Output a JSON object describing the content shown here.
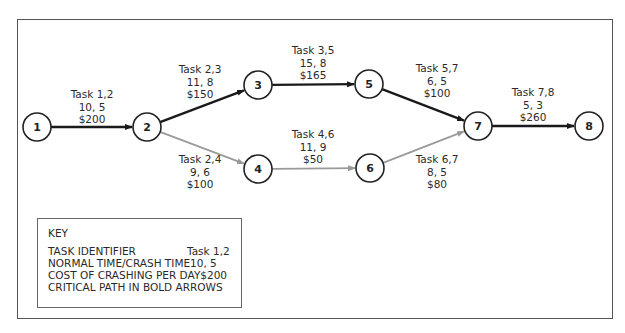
{
  "diagram": {
    "nodes": [
      {
        "id": "1",
        "x": 37,
        "y": 127
      },
      {
        "id": "2",
        "x": 147,
        "y": 127
      },
      {
        "id": "3",
        "x": 258,
        "y": 85
      },
      {
        "id": "4",
        "x": 258,
        "y": 169
      },
      {
        "id": "5",
        "x": 369,
        "y": 84
      },
      {
        "id": "6",
        "x": 370,
        "y": 168
      },
      {
        "id": "7",
        "x": 478,
        "y": 126
      },
      {
        "id": "8",
        "x": 589,
        "y": 126
      }
    ],
    "tasks": [
      {
        "from": "1",
        "to": "2",
        "label": "Task 1,2",
        "times": "10, 5",
        "cost": "$200",
        "critical": true
      },
      {
        "from": "2",
        "to": "3",
        "label": "Task 2,3",
        "times": "11, 8",
        "cost": "$150",
        "critical": true
      },
      {
        "from": "2",
        "to": "4",
        "label": "Task 2,4",
        "times": "9, 6",
        "cost": "$100",
        "critical": false
      },
      {
        "from": "3",
        "to": "5",
        "label": "Task 3,5",
        "times": "15, 8",
        "cost": "$165",
        "critical": true
      },
      {
        "from": "4",
        "to": "6",
        "label": "Task 4,6",
        "times": "11, 9",
        "cost": "$50",
        "critical": false
      },
      {
        "from": "5",
        "to": "7",
        "label": "Task 5,7",
        "times": "6, 5",
        "cost": "$100",
        "critical": true
      },
      {
        "from": "6",
        "to": "7",
        "label": "Task 6,7",
        "times": "8, 5",
        "cost": "$80",
        "critical": false
      },
      {
        "from": "7",
        "to": "8",
        "label": "Task 7,8",
        "times": "5, 3",
        "cost": "$260",
        "critical": true
      }
    ],
    "colors": {
      "critical": "#1a1a1a",
      "noncritical": "#9a9a9a",
      "node_stroke": "#222222"
    }
  },
  "key": {
    "title": "KEY",
    "rows": [
      {
        "label": "TASK IDENTIFIER",
        "value": "Task 1,2"
      },
      {
        "label": "NORMAL TIME/CRASH TIME",
        "value": "10, 5"
      },
      {
        "label": "COST OF CRASHING PER DAY",
        "value": "$200"
      },
      {
        "label": "CRITICAL PATH IN BOLD ARROWS",
        "value": ""
      }
    ]
  }
}
